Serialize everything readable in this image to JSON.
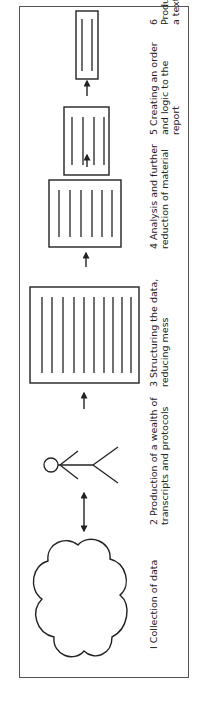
{
  "figure": {
    "orientation": "rotated-90-ccw",
    "border_color": "#555555",
    "stroke_color": "#222222",
    "steps": [
      {
        "number": "1",
        "label": "1 Collection of data",
        "label_lines": [
          "I Collection of data"
        ],
        "icon": "cloud-icon"
      },
      {
        "number": "2",
        "label": "2 Production of a wealth of transcripts and protocols",
        "label_lines": [
          "2 Production of a wealth of",
          "transcripts and protocols"
        ],
        "icon": "person-icon"
      },
      {
        "number": "3",
        "label": "3 Structuring the data, reducing mess",
        "label_lines": [
          "3 Structuring the data,",
          "reducing mess"
        ],
        "icon": "document-stack-icon",
        "line_count": 10
      },
      {
        "number": "4",
        "label": "4 Analysis and further reduction of material",
        "label_lines": [
          "4 Analysis and further",
          "reduction of material"
        ],
        "icon": "document-icon",
        "line_count": 6
      },
      {
        "number": "5",
        "label": "5 Creating an order and logic to the report",
        "label_lines": [
          "5 Creating an order",
          "and logic to the",
          "report"
        ],
        "icon": "document-icon",
        "line_count": 4
      },
      {
        "number": "6",
        "label": "6 Producing a text",
        "label_lines": [
          "6 Producing a text"
        ],
        "icon": "document-icon",
        "line_count": 2
      }
    ],
    "connectors": [
      {
        "from": "1",
        "to": "2",
        "type": "double-arrow"
      },
      {
        "from": "2",
        "to": "3",
        "type": "arrow"
      },
      {
        "from": "3",
        "to": "4",
        "type": "arrow"
      },
      {
        "from": "4",
        "to": "5",
        "type": "arrow"
      },
      {
        "from": "5",
        "to": "6",
        "type": "arrow"
      }
    ],
    "labels": {
      "step1": "I Collection of data",
      "step2": "2 Production of a wealth of\ntranscripts and protocols",
      "step3": "3 Structuring the data,\n   reducing mess",
      "step4": "4 Analysis and further\n   reduction of material",
      "step5": "5 Creating an order\n   and logic to the\n   report",
      "step6": "6 Producing a text"
    }
  }
}
